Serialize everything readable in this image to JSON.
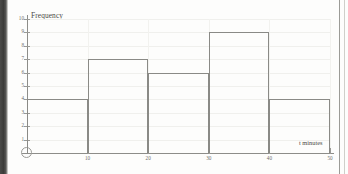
{
  "chart_data": {
    "type": "bar",
    "title": "",
    "subtitle": "",
    "xlabel": "t minutes",
    "ylabel": "Frequency",
    "categories": [
      "0-10",
      "10-20",
      "20-30",
      "30-40",
      "40-50"
    ],
    "values": [
      4,
      7,
      6,
      9,
      4
    ],
    "bin_edges": [
      0,
      10,
      20,
      30,
      40,
      50
    ],
    "xlim": [
      0,
      50
    ],
    "ylim": [
      0,
      10
    ],
    "x_ticks": [
      10,
      20,
      30,
      40,
      50
    ],
    "x_tick_labels": [
      "10",
      "20",
      "30",
      "40",
      "50"
    ],
    "y_ticks": [
      1,
      2,
      3,
      4,
      5,
      6,
      7,
      8,
      9,
      10
    ],
    "y_tick_labels": [
      "1",
      "2",
      "3",
      "4",
      "5",
      "6",
      "7",
      "8",
      "9",
      "10"
    ],
    "grid": true,
    "legend": "none",
    "bar_fill": "none",
    "bar_edge_color": "#8a8a86",
    "axis_color": "#8d8d89",
    "grid_color": "#f0f0ed",
    "background": "#fdfdfc",
    "origin_marker": "open-circle"
  }
}
